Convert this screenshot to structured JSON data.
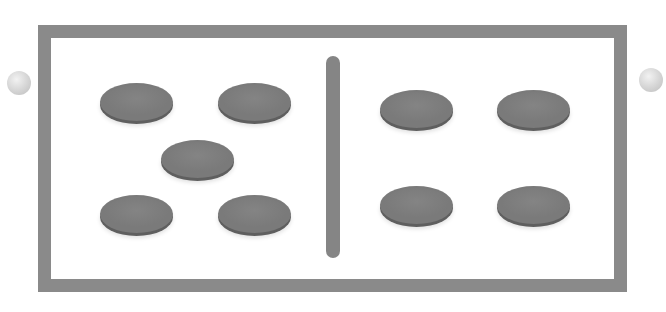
{
  "tile": {
    "type": "domino",
    "left_half": {
      "value": 5,
      "pips": [
        {
          "cx": 136,
          "cy": 102
        },
        {
          "cx": 254,
          "cy": 102
        },
        {
          "cx": 197,
          "cy": 159
        },
        {
          "cx": 136,
          "cy": 214
        },
        {
          "cx": 254,
          "cy": 214
        }
      ]
    },
    "right_half": {
      "value": 4,
      "pips": [
        {
          "cx": 416,
          "cy": 109
        },
        {
          "cx": 534,
          "cy": 109
        },
        {
          "cx": 416,
          "cy": 205
        },
        {
          "cx": 534,
          "cy": 205
        }
      ]
    },
    "colors": {
      "frame": "#8a8a8a",
      "pip": "#7a7a7a",
      "divider": "#858585",
      "background": "#ffffff"
    }
  },
  "nav": {
    "left_ball": {
      "cx": 19,
      "cy": 83
    },
    "right_ball": {
      "cx": 651,
      "cy": 80
    }
  }
}
